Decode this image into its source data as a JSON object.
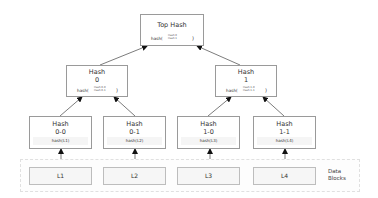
{
  "diagram": {
    "top": {
      "title": "Top Hash",
      "fn": "hash(",
      "args": [
        "Hash 0",
        "Hash 1"
      ],
      "close": ")"
    },
    "mid": [
      {
        "title": "Hash",
        "sub": "0",
        "fn": "hash(",
        "args": [
          "Hash 0-0",
          "Hash 0-1"
        ],
        "close": ")"
      },
      {
        "title": "Hash",
        "sub": "1",
        "fn": "hash(",
        "args": [
          "Hash 1-0",
          "Hash 1-1"
        ],
        "close": ")"
      }
    ],
    "leaves": [
      {
        "title": "Hash",
        "sub": "0-0",
        "hash": "hash(L1)"
      },
      {
        "title": "Hash",
        "sub": "0-1",
        "hash": "hash(L2)"
      },
      {
        "title": "Hash",
        "sub": "1-0",
        "hash": "hash(L3)"
      },
      {
        "title": "Hash",
        "sub": "1-1",
        "hash": "hash(L4)"
      }
    ],
    "data_blocks": {
      "label_line1": "Data",
      "label_line2": "Blocks",
      "items": [
        "L1",
        "L2",
        "L3",
        "L4"
      ]
    },
    "edges": [
      {
        "from": "leaf-0",
        "to": "mid-0"
      },
      {
        "from": "leaf-1",
        "to": "mid-0"
      },
      {
        "from": "leaf-2",
        "to": "mid-1"
      },
      {
        "from": "leaf-3",
        "to": "mid-1"
      },
      {
        "from": "mid-0",
        "to": "top"
      },
      {
        "from": "mid-1",
        "to": "top"
      },
      {
        "from": "block-0",
        "to": "leaf-0"
      },
      {
        "from": "block-1",
        "to": "leaf-1"
      },
      {
        "from": "block-2",
        "to": "leaf-2"
      },
      {
        "from": "block-3",
        "to": "leaf-3"
      }
    ]
  }
}
